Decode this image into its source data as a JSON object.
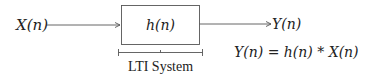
{
  "diagram": {
    "input_label": "X(n)",
    "system_label": "h(n)",
    "output_label": "Y(n)",
    "bracket_label": "LTI System",
    "equation": "Y(n) = h(n) * X(n)",
    "colors": {
      "line": "#555555",
      "text": "#222222",
      "background": "#ffffff"
    }
  }
}
